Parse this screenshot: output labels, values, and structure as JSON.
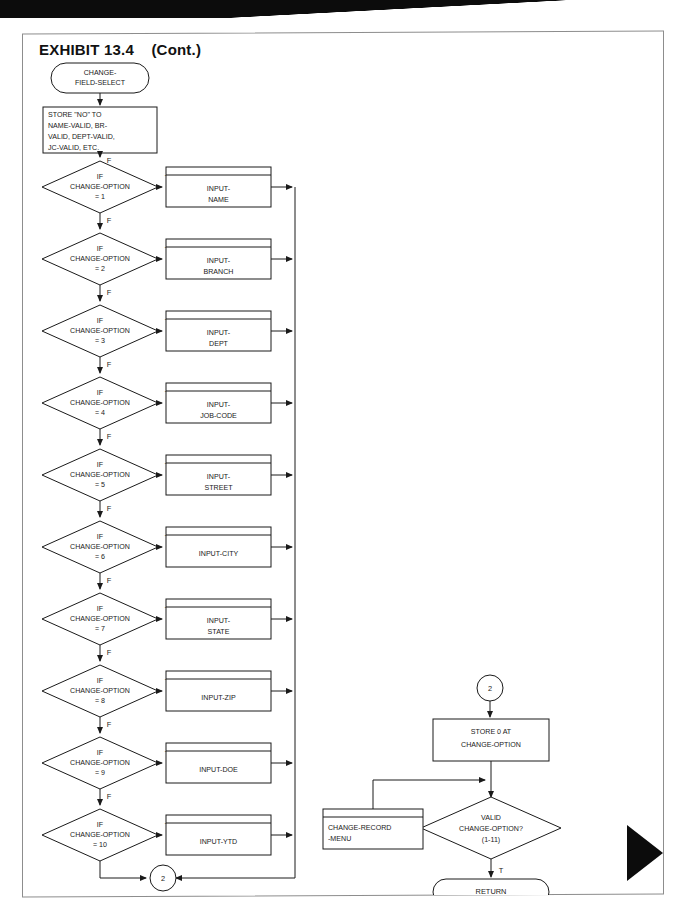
{
  "page": {
    "exhibit_title": "EXHIBIT 13.4    (Cont.)",
    "sheet_border_color": "#8d8d8d",
    "ink_color": "#1a1a1a",
    "tab_marker_color": "#0c0c0c"
  },
  "chart_data": {
    "type": "diagram",
    "title": "EXHIBIT 13.4    (Cont.)",
    "diagram_kind": "program-flowchart",
    "notation": "ANSI flowchart: terminal (stadium), process (rectangle), predefined-process (rectangle with top header rule), decision (diamond), connector (circle)",
    "branch_labels": {
      "true": "T",
      "false": "F"
    }
  },
  "start_terminal": {
    "line1": "CHANGE-",
    "line2": "FIELD-SELECT"
  },
  "init_process": {
    "line1": "STORE \"NO\" TO",
    "line2": "NAME-VALID, BR-",
    "line3": "VALID, DEPT-VALID,",
    "line4": "JC-VALID, ETC."
  },
  "decisions": [
    {
      "l1": "IF",
      "l2": "CHANGE-OPTION",
      "l3": "= 1",
      "t": "T",
      "f": "F"
    },
    {
      "l1": "IF",
      "l2": "CHANGE-OPTION",
      "l3": "= 2",
      "t": "T",
      "f": "F"
    },
    {
      "l1": "IF",
      "l2": "CHANGE-OPTION",
      "l3": "= 3",
      "t": "T",
      "f": "F"
    },
    {
      "l1": "IF",
      "l2": "CHANGE-OPTION",
      "l3": "= 4",
      "t": "T",
      "f": "F"
    },
    {
      "l1": "IF",
      "l2": "CHANGE-OPTION",
      "l3": "= 5",
      "t": "T",
      "f": "F"
    },
    {
      "l1": "IF",
      "l2": "CHANGE-OPTION",
      "l3": "= 6",
      "t": "T",
      "f": "F"
    },
    {
      "l1": "IF",
      "l2": "CHANGE-OPTION",
      "l3": "= 7",
      "t": "T",
      "f": "F"
    },
    {
      "l1": "IF",
      "l2": "CHANGE-OPTION",
      "l3": "= 8",
      "t": "T",
      "f": "F"
    },
    {
      "l1": "IF",
      "l2": "CHANGE-OPTION",
      "l3": "= 9",
      "t": "T",
      "f": "F"
    },
    {
      "l1": "IF",
      "l2": "CHANGE-OPTION",
      "l3": "= 10",
      "t": "T",
      "f": "F"
    }
  ],
  "modules": [
    {
      "l1": "INPUT-",
      "l2": "NAME"
    },
    {
      "l1": "INPUT-",
      "l2": "BRANCH"
    },
    {
      "l1": "INPUT-",
      "l2": "DEPT"
    },
    {
      "l1": "INPUT-",
      "l2": "JOB-CODE"
    },
    {
      "l1": "INPUT-",
      "l2": "STREET"
    },
    {
      "l1": "INPUT-CITY",
      "l2": ""
    },
    {
      "l1": "INPUT-",
      "l2": "STATE"
    },
    {
      "l1": "INPUT-ZIP",
      "l2": ""
    },
    {
      "l1": "INPUT-DOE",
      "l2": ""
    },
    {
      "l1": "INPUT-YTD",
      "l2": ""
    }
  ],
  "connector_bottom": {
    "label": "2"
  },
  "connector_right": {
    "label": "2"
  },
  "store_zero_process": {
    "line1": "STORE 0 AT",
    "line2": "CHANGE-OPTION"
  },
  "valid_decision": {
    "l1": "VALID",
    "l2": "CHANGE-OPTION?",
    "l3": "(1-11)",
    "t": "T",
    "f": "F"
  },
  "menu_module": {
    "line1": "CHANGE-RECORD",
    "line2": "-MENU"
  },
  "return_terminal": {
    "label": "RETURN"
  }
}
